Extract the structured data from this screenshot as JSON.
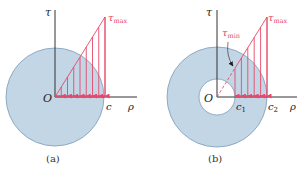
{
  "colors": {
    "disk_fill": "#c3d6e6",
    "disk_stroke": "#7b9ab8",
    "stress": "#e8476a",
    "axis": "#333333",
    "text": "#222222"
  },
  "panel_a": {
    "caption": "(a)",
    "origin_label": "O",
    "tau_axis_label": "τ",
    "rho_axis_label": "ρ",
    "radius_label": "c",
    "tau_max_symbol": "τ",
    "tau_max_subscript": "max"
  },
  "panel_b": {
    "caption": "(b)",
    "origin_label": "O",
    "tau_axis_label": "τ",
    "rho_axis_label": "ρ",
    "inner_radius_symbol": "c",
    "inner_radius_subscript": "1",
    "outer_radius_symbol": "c",
    "outer_radius_subscript": "2",
    "tau_max_symbol": "τ",
    "tau_max_subscript": "max",
    "tau_min_symbol": "τ",
    "tau_min_subscript": "min"
  }
}
